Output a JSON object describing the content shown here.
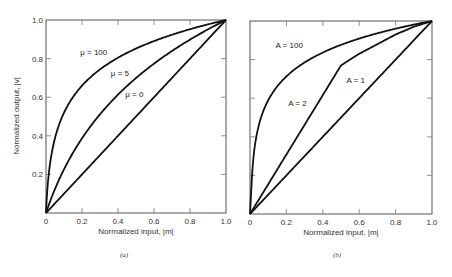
{
  "chart_data": [
    {
      "id": "a",
      "type": "line",
      "title": "",
      "caption": "(a)",
      "xlabel": "Normalized input, |m|",
      "ylabel": "Normalized output, |v|",
      "xlim": [
        0,
        1.0
      ],
      "ylim": [
        0,
        1.0
      ],
      "xticks": [
        "0",
        "0.2",
        "0.4",
        "0.6",
        "0.8",
        "1.0"
      ],
      "yticks": [
        "0.2",
        "0.4",
        "0.6",
        "0.8",
        "1.0"
      ],
      "grid": false,
      "legend": "inline labels",
      "series": [
        {
          "name": "μ = 100",
          "label": "μ = 100",
          "law": "mu",
          "param": 100,
          "x": [
            0,
            0.01,
            0.02,
            0.05,
            0.1,
            0.2,
            0.3,
            0.4,
            0.5,
            0.6,
            0.7,
            0.8,
            0.9,
            1.0
          ],
          "values": [
            0,
            0.15,
            0.24,
            0.39,
            0.52,
            0.66,
            0.75,
            0.81,
            0.85,
            0.89,
            0.93,
            0.95,
            0.98,
            1.0
          ]
        },
        {
          "name": "μ = 5",
          "label": "μ = 5",
          "law": "mu",
          "param": 5,
          "x": [
            0,
            0.1,
            0.2,
            0.3,
            0.4,
            0.5,
            0.6,
            0.7,
            0.8,
            0.9,
            1.0
          ],
          "values": [
            0,
            0.23,
            0.39,
            0.51,
            0.61,
            0.7,
            0.77,
            0.84,
            0.9,
            0.95,
            1.0
          ]
        },
        {
          "name": "μ = 0",
          "label": "μ = 0",
          "law": "mu",
          "param": 0,
          "x": [
            0,
            1.0
          ],
          "values": [
            0,
            1.0
          ]
        }
      ],
      "labels": [
        {
          "text": "μ = 100",
          "x": 0.19,
          "y": 0.82
        },
        {
          "text": "μ = 5",
          "x": 0.36,
          "y": 0.71
        },
        {
          "text": "μ = 0",
          "x": 0.44,
          "y": 0.6
        }
      ]
    },
    {
      "id": "b",
      "type": "line",
      "title": "",
      "caption": "(b)",
      "xlabel": "Normalized input, |m|",
      "ylabel": "",
      "xlim": [
        0,
        1.0
      ],
      "ylim": [
        0,
        1.0
      ],
      "xticks": [
        "0",
        "0.2",
        "0.4",
        "0.6",
        "0.8",
        "1.0"
      ],
      "yticks": [],
      "grid": false,
      "legend": "inline labels",
      "series": [
        {
          "name": "A = 100",
          "label": "A = 100",
          "law": "A",
          "param": 100,
          "x": [
            0,
            0.01,
            0.02,
            0.05,
            0.1,
            0.2,
            0.3,
            0.4,
            0.5,
            0.6,
            0.7,
            0.8,
            0.9,
            1.0
          ],
          "values": [
            0,
            0.18,
            0.32,
            0.52,
            0.65,
            0.78,
            0.84,
            0.88,
            0.91,
            0.93,
            0.95,
            0.97,
            0.98,
            1.0
          ]
        },
        {
          "name": "A = 2",
          "label": "A = 2",
          "law": "A",
          "param": 2,
          "x": [
            0,
            0.5,
            0.6,
            0.7,
            0.8,
            0.9,
            1.0
          ],
          "values": [
            0,
            0.77,
            0.83,
            0.88,
            0.93,
            0.97,
            1.0
          ]
        },
        {
          "name": "A = 1",
          "label": "A = 1",
          "law": "A",
          "param": 1,
          "x": [
            0,
            1.0
          ],
          "values": [
            0,
            1.0
          ]
        }
      ],
      "labels": [
        {
          "text": "A = 100",
          "x": 0.14,
          "y": 0.86
        },
        {
          "text": "A = 1",
          "x": 0.53,
          "y": 0.68
        },
        {
          "text": "A = 2",
          "x": 0.21,
          "y": 0.56
        }
      ]
    }
  ],
  "panels": {
    "a": {
      "frame": {
        "left": 46,
        "top": 20,
        "right": 226,
        "bottom": 213
      },
      "caption_pos": {
        "x": 124,
        "y": 257
      }
    },
    "b": {
      "frame": {
        "left": 250,
        "top": 21,
        "right": 432,
        "bottom": 214
      },
      "caption_pos": {
        "x": 337,
        "y": 257
      }
    }
  }
}
